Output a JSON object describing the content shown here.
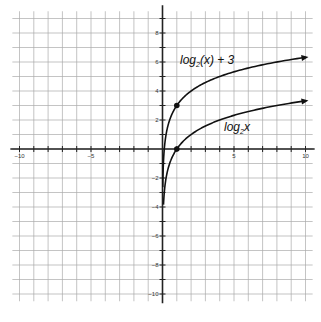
{
  "chart_data": {
    "type": "line",
    "title": "",
    "xlabel": "",
    "ylabel": "",
    "xlim": [
      -10.5,
      10.5
    ],
    "ylim": [
      -10.5,
      9.5
    ],
    "grid": true,
    "x_ticks": [
      -10,
      -5,
      5,
      10
    ],
    "y_ticks": [
      8,
      6,
      4,
      2,
      -2,
      -4,
      -6,
      -8,
      -10
    ],
    "series": [
      {
        "name": "log2(x) + 3",
        "label_base": "log",
        "label_sub": "2",
        "label_rest": "(x) + 3",
        "function": "log2(x)+3",
        "x_range": [
          0.02,
          10
        ],
        "marked_points": [
          [
            1,
            3
          ]
        ],
        "arrow_end": true
      },
      {
        "name": "log2 x",
        "label_base": "log",
        "label_sub": "2",
        "label_rest": "x",
        "function": "log2(x)",
        "x_range": [
          0.07,
          10
        ],
        "marked_points": [
          [
            1,
            0
          ]
        ],
        "arrow_end": true
      }
    ]
  }
}
